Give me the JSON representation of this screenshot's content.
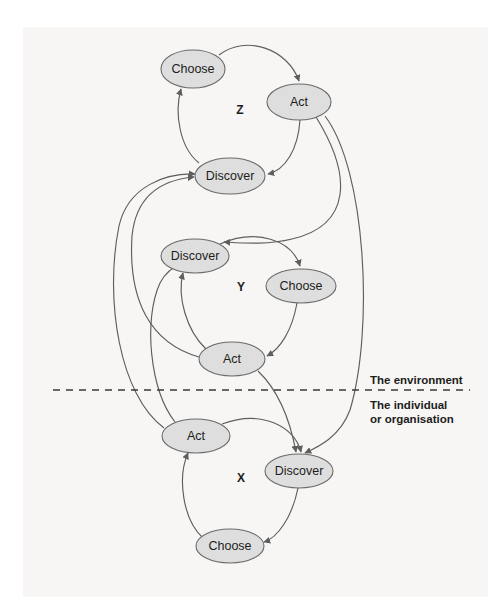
{
  "diagram": {
    "canvas": {
      "width": 503,
      "height": 605
    },
    "colors": {
      "page_background": "#ffffff",
      "paper_background": "#f7f6f4",
      "node_fill": "#dedede",
      "node_stroke": "#6b6b6b",
      "edge_stroke": "#5e5e5e",
      "text": "#1d1d1b",
      "divider": "#3a3a3a"
    },
    "divider": {
      "name": "environment-individual-divider",
      "style": "dashed",
      "x1": 53,
      "x2": 470,
      "y": 390
    },
    "zone_labels": [
      {
        "id": "environment",
        "text": "The environment",
        "x": 370,
        "y": 384
      },
      {
        "id": "individual-line1",
        "text": "The individual",
        "x": 370,
        "y": 409
      },
      {
        "id": "individual-line2",
        "text": "or organisation",
        "x": 370,
        "y": 423
      }
    ],
    "clusters": [
      {
        "id": "Z",
        "label": "Z",
        "x": 240,
        "y": 114
      },
      {
        "id": "Y",
        "label": "Y",
        "x": 241,
        "y": 291
      },
      {
        "id": "X",
        "label": "X",
        "x": 241,
        "y": 482
      }
    ],
    "nodes": [
      {
        "id": "z-choose",
        "cluster": "Z",
        "label": "Choose",
        "cx": 193,
        "cy": 69,
        "rx": 32,
        "ry": 19
      },
      {
        "id": "z-act",
        "cluster": "Z",
        "label": "Act",
        "cx": 299,
        "cy": 102,
        "rx": 32,
        "ry": 18
      },
      {
        "id": "z-discover",
        "cluster": "Z",
        "label": "Discover",
        "cx": 230,
        "cy": 176,
        "rx": 35,
        "ry": 18
      },
      {
        "id": "y-discover",
        "cluster": "Y",
        "label": "Discover",
        "cx": 195,
        "cy": 256,
        "rx": 34,
        "ry": 17
      },
      {
        "id": "y-choose",
        "cluster": "Y",
        "label": "Choose",
        "cx": 301,
        "cy": 286,
        "rx": 35,
        "ry": 17
      },
      {
        "id": "y-act",
        "cluster": "Y",
        "label": "Act",
        "cx": 232,
        "cy": 359,
        "rx": 33,
        "ry": 17
      },
      {
        "id": "x-act",
        "cluster": "X",
        "label": "Act",
        "cx": 196,
        "cy": 436,
        "rx": 34,
        "ry": 17
      },
      {
        "id": "x-discover",
        "cluster": "X",
        "label": "Discover",
        "cx": 299,
        "cy": 471,
        "rx": 34,
        "ry": 17
      },
      {
        "id": "x-choose",
        "cluster": "X",
        "label": "Choose",
        "cx": 230,
        "cy": 546,
        "rx": 34,
        "ry": 17
      }
    ],
    "edges": [
      {
        "id": "z-choose-to-z-act",
        "from": "z-choose",
        "to": "z-act"
      },
      {
        "id": "z-act-to-z-discover",
        "from": "z-act",
        "to": "z-discover"
      },
      {
        "id": "z-discover-to-z-choose",
        "from": "z-discover",
        "to": "z-choose"
      },
      {
        "id": "y-discover-to-y-choose",
        "from": "y-discover",
        "to": "y-choose"
      },
      {
        "id": "y-choose-to-y-act",
        "from": "y-choose",
        "to": "y-act"
      },
      {
        "id": "y-act-to-y-discover",
        "from": "y-act",
        "to": "y-discover"
      },
      {
        "id": "x-act-to-x-discover",
        "from": "x-act",
        "to": "x-discover"
      },
      {
        "id": "x-discover-to-x-choose",
        "from": "x-discover",
        "to": "x-choose"
      },
      {
        "id": "x-choose-to-x-act",
        "from": "x-choose",
        "to": "x-act"
      },
      {
        "id": "z-act-to-x-discover",
        "from": "z-act",
        "to": "x-discover"
      },
      {
        "id": "z-act-to-y-discover",
        "from": "z-act",
        "to": "y-discover"
      },
      {
        "id": "y-act-to-x-discover",
        "from": "y-act",
        "to": "x-discover"
      },
      {
        "id": "y-act-to-z-discover",
        "from": "y-act",
        "to": "z-discover"
      },
      {
        "id": "x-act-to-y-discover",
        "from": "x-act",
        "to": "y-discover"
      },
      {
        "id": "x-act-to-z-discover",
        "from": "x-act",
        "to": "z-discover"
      }
    ]
  }
}
